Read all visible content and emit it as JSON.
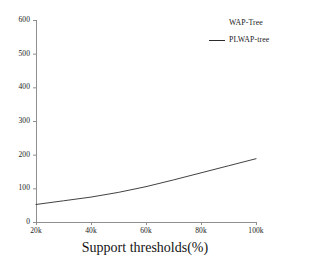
{
  "chart_data": {
    "type": "line",
    "title": "",
    "xlabel": "Support thresholds(%)",
    "ylabel": "",
    "grid": false,
    "legend_position": "top-right",
    "xtick_labels": [
      "20k",
      "40k",
      "60k",
      "80k",
      "100k"
    ],
    "xtick_values": [
      20000,
      40000,
      60000,
      80000,
      100000
    ],
    "ytick_labels": [
      "0",
      "100",
      "200",
      "300",
      "400",
      "500",
      "600"
    ],
    "ytick_values": [
      0,
      100,
      200,
      300,
      400,
      500,
      600
    ],
    "xlim": [
      20000,
      100000
    ],
    "ylim": [
      0,
      600
    ],
    "line_color": "#2b2b2b",
    "axis_color": "#8a8a8a",
    "series": [
      {
        "name": "WAP-Tree",
        "marker": "none",
        "x": [],
        "values": []
      },
      {
        "name": "PLWAP-tree",
        "marker": "line",
        "x": [
          20000,
          30000,
          40000,
          50000,
          60000,
          70000,
          80000,
          90000,
          100000
        ],
        "values": [
          52,
          63,
          74,
          88,
          105,
          125,
          146,
          167,
          188
        ]
      }
    ]
  },
  "legend": {
    "entries": [
      {
        "label": "WAP-Tree",
        "has_line": false
      },
      {
        "label": "PLWAP-tree",
        "has_line": true
      }
    ]
  },
  "axis": {
    "x_title": "Support thresholds(%)"
  }
}
